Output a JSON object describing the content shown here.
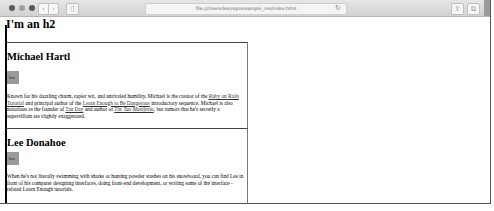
{
  "browser": {
    "url": "file:///Users/lee/repos/sample_css/index.html",
    "buttons": {
      "back": "‹",
      "forward": "›",
      "sidebar": "▯",
      "reload": "↻",
      "share": "⇪",
      "tabs": "⧉"
    },
    "icons": {
      "close": "close-dot",
      "minimize": "minimize-dot",
      "maximize": "maximize-dot"
    }
  },
  "page": {
    "heading": "I'm an h2",
    "bios": [
      {
        "name": "Michael Hartl",
        "tag": "bio",
        "text_parts": {
          "p1": "Known for his dazzling charm, rapier wit, and unrivaled humility, Michael is the creator of the ",
          "link1": "Ruby on Rails Tutorial",
          "p2": " and principal author of the ",
          "link2": "Learn Enough to Be Dangerous",
          "p3": " introductory sequence. Michael is also notorious as the founder of ",
          "link3": "Tau Day",
          "p4": " and author of ",
          "link4": "The Tau Manifesto",
          "p5": ", but rumors that he's secretly a supervillain are slightly exaggerated."
        }
      },
      {
        "name": "Lee Donahoe",
        "tag": "bio",
        "text": "When he's not literally swimming with sharks or hunting powder stashes on his snowboard, you can find Lee in front of his computer designing interfaces, doing front-end development, or writing some of the interface -related Learn Enough tutorials."
      }
    ]
  }
}
